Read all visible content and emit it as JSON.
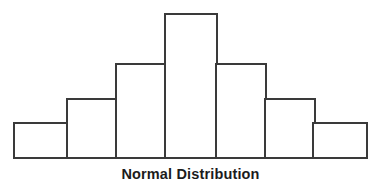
{
  "figure": {
    "caption": "Normal Distribution",
    "background_color": "#ffffff",
    "stroke_color": "#3a3a3a",
    "fill_color": "#ffffff",
    "caption_color": "#1c1c1c"
  },
  "chart_data": {
    "type": "bar",
    "title": "Normal Distribution",
    "subtitle": "",
    "xlabel": "",
    "ylabel": "",
    "grid": false,
    "legend": "none",
    "axis_visible": {
      "x_baseline": true,
      "y_axis": false,
      "ticks": false,
      "tick_labels": false
    },
    "categories": [
      "1",
      "2",
      "3",
      "4",
      "5",
      "6",
      "7"
    ],
    "values": [
      1,
      2,
      3,
      5,
      3,
      2,
      1
    ],
    "ylim": [
      0,
      5
    ],
    "bar_geometry_px": [
      {
        "x": 14,
        "width": 54,
        "top": 123,
        "height": 35
      },
      {
        "x": 67,
        "width": 50,
        "top": 99,
        "height": 59
      },
      {
        "x": 116,
        "width": 50,
        "top": 64,
        "height": 94
      },
      {
        "x": 165,
        "width": 52,
        "top": 14,
        "height": 144
      },
      {
        "x": 216,
        "width": 50,
        "top": 64,
        "height": 94
      },
      {
        "x": 265,
        "width": 50,
        "top": 99,
        "height": 59
      },
      {
        "x": 313,
        "width": 54,
        "top": 123,
        "height": 35
      }
    ],
    "baseline_y_px": 158,
    "annotations": []
  }
}
